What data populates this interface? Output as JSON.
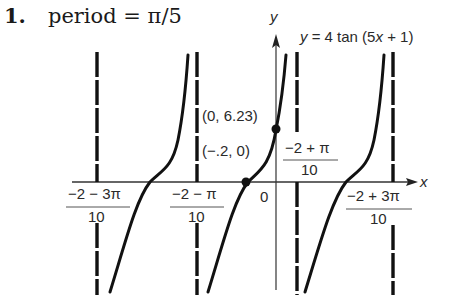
{
  "problem": {
    "number": "1.",
    "statement": "period = π/5"
  },
  "graph": {
    "equation_label": "y = 4 tan (5x + 1)",
    "x_axis_label": "x",
    "y_axis_label": "y",
    "origin_label": "0",
    "points": [
      {
        "label": "(0, 6.23)",
        "x": 0,
        "y": 6.23
      },
      {
        "label": "(−.2, 0)",
        "x": -0.2,
        "y": 0
      }
    ],
    "asymptote_labels": [
      {
        "numerator": "−2 − 3π",
        "denominator": "10"
      },
      {
        "numerator": "−2 − π",
        "denominator": "10"
      },
      {
        "numerator": "−2 + π",
        "denominator": "10"
      },
      {
        "numerator": "−2 + 3π",
        "denominator": "10"
      }
    ]
  },
  "colors": {
    "ink": "#111111",
    "axis": "#333333",
    "background": "#ffffff"
  }
}
